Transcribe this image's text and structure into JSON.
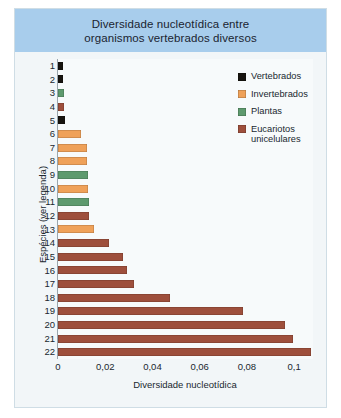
{
  "title": "Diversidade nucleotídica entre\norganismos vertebrados diversos",
  "axes": {
    "ylabel": "Espécies (ver legenda)",
    "xlabel": "Diversidade nucleotídica",
    "xticks": [
      "0",
      "0,02",
      "0,04",
      "0,06",
      "0,08",
      "0,1"
    ]
  },
  "legend": {
    "items": [
      {
        "label": "Vertebrados",
        "color": "#17140f"
      },
      {
        "label": "Invertebrados",
        "color": "#efa159"
      },
      {
        "label": "Plantas",
        "color": "#5e9a6e"
      },
      {
        "label": "Eucariotos\nunicelulares",
        "color": "#9e4f3c"
      }
    ]
  },
  "colors": {
    "title_band": "#a8cdec",
    "panel": "#f2f6f8",
    "plot": "#f7fafb",
    "vertebrados": "#17140f",
    "invertebrados": "#efa159",
    "plantas": "#5e9a6e",
    "eucariotos": "#9e4f3c"
  },
  "chart_data": {
    "type": "bar",
    "orientation": "horizontal",
    "title": "Diversidade nucleotídica entre organismos vertebrados diversos",
    "xlabel": "Diversidade nucleotídica",
    "ylabel": "Espécies (ver legenda)",
    "xlim": [
      0,
      0.108
    ],
    "xticks": [
      0,
      0.02,
      0.04,
      0.06,
      0.08,
      0.1
    ],
    "grid": false,
    "legend_position": "top-right",
    "categories": [
      "1",
      "2",
      "3",
      "4",
      "5",
      "6",
      "7",
      "8",
      "9",
      "10",
      "11",
      "12",
      "13",
      "14",
      "15",
      "16",
      "17",
      "18",
      "19",
      "20",
      "21",
      "22"
    ],
    "values": [
      0.0022,
      0.0022,
      0.0026,
      0.0027,
      0.0031,
      0.0098,
      0.0122,
      0.0124,
      0.0127,
      0.0129,
      0.0131,
      0.0133,
      0.0152,
      0.0218,
      0.0276,
      0.0293,
      0.032,
      0.0476,
      0.0782,
      0.096,
      0.0996,
      0.1071
    ],
    "groups": [
      "Vertebrados",
      "Vertebrados",
      "Plantas",
      "Eucariotos unicelulares",
      "Vertebrados",
      "Invertebrados",
      "Invertebrados",
      "Invertebrados",
      "Plantas",
      "Invertebrados",
      "Plantas",
      "Eucariotos unicelulares",
      "Invertebrados",
      "Eucariotos unicelulares",
      "Eucariotos unicelulares",
      "Eucariotos unicelulares",
      "Eucariotos unicelulares",
      "Eucariotos unicelulares",
      "Eucariotos unicelulares",
      "Eucariotos unicelulares",
      "Eucariotos unicelulares",
      "Eucariotos unicelulares"
    ],
    "bar_colors": [
      "#17140f",
      "#17140f",
      "#5e9a6e",
      "#9e4f3c",
      "#17140f",
      "#efa159",
      "#efa159",
      "#efa159",
      "#5e9a6e",
      "#efa159",
      "#5e9a6e",
      "#9e4f3c",
      "#efa159",
      "#9e4f3c",
      "#9e4f3c",
      "#9e4f3c",
      "#9e4f3c",
      "#9e4f3c",
      "#9e4f3c",
      "#9e4f3c",
      "#9e4f3c",
      "#9e4f3c"
    ]
  }
}
